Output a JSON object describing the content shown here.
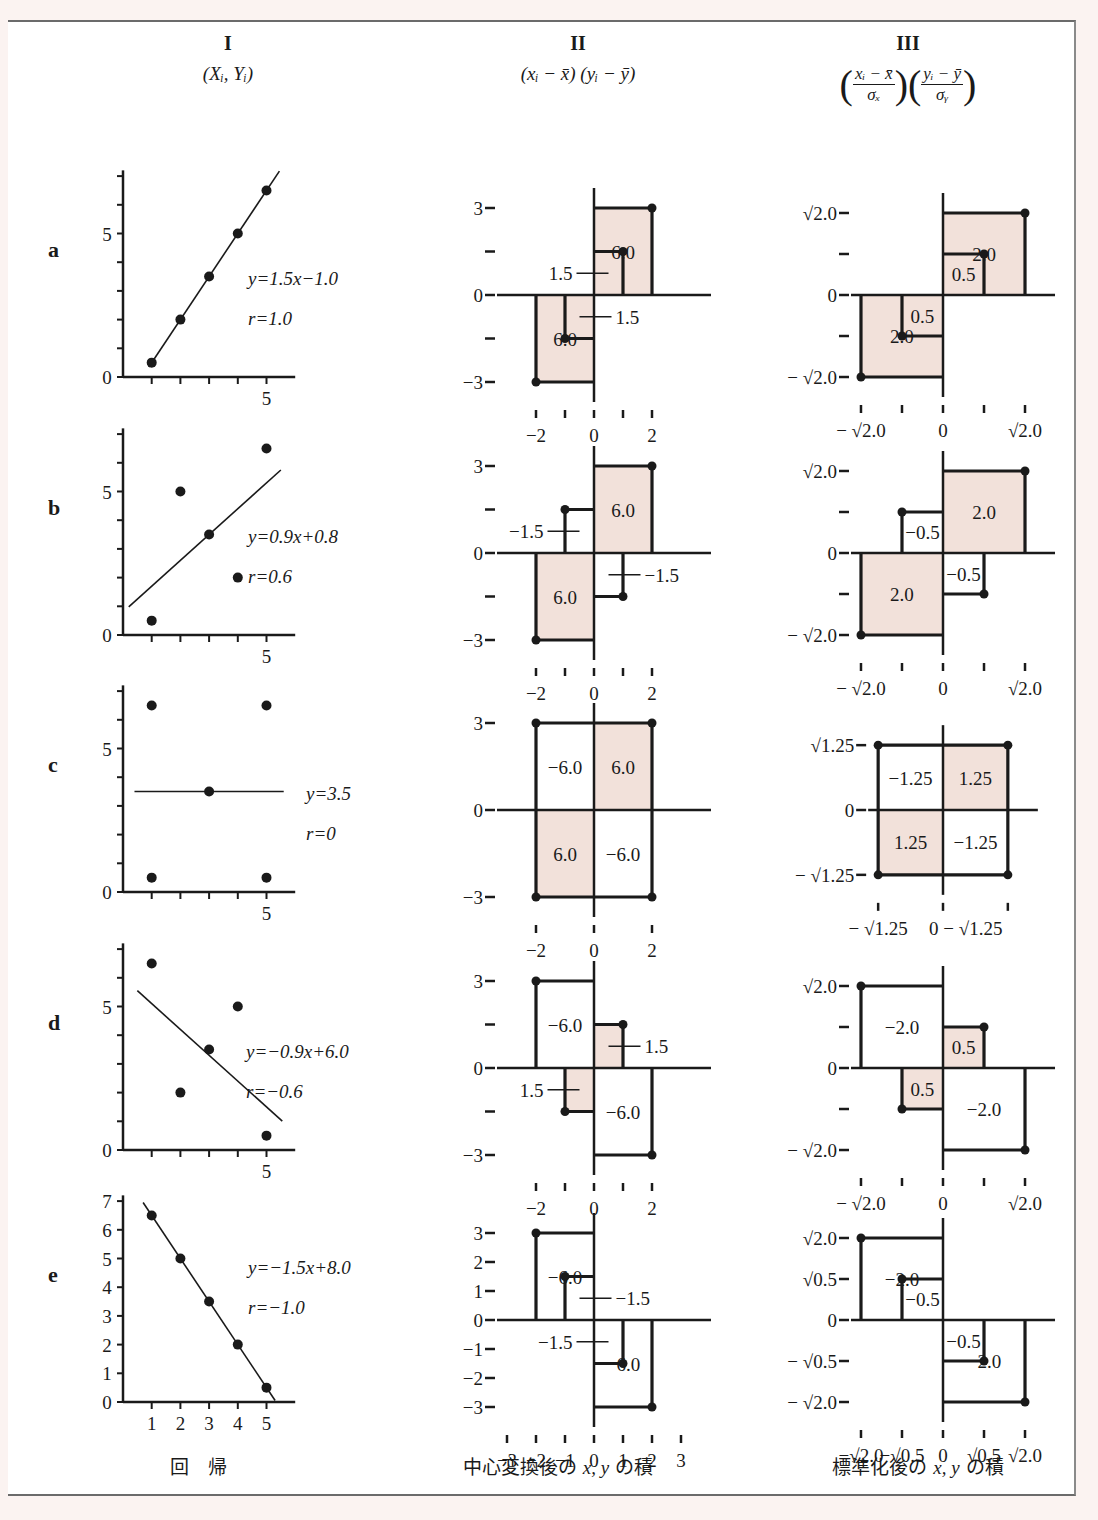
{
  "columns": [
    {
      "roman": "I",
      "formula": "(Xᵢ,  Yᵢ)"
    },
    {
      "roman": "II",
      "formula": "(xᵢ − x̄) (yᵢ − ȳ)"
    },
    {
      "roman": "III",
      "formula_num_x": "xᵢ − x̄",
      "formula_den_x": "σₓ",
      "formula_num_y": "yᵢ − ȳ",
      "formula_den_y": "σᵧ"
    }
  ],
  "footer": {
    "col1": "回　帰",
    "col2_pre": "中心変換後の ",
    "col2_vars": "x, y",
    "col2_post": " の積",
    "col3_pre": "標準化後の ",
    "col3_vars": "x, y",
    "col3_post": " の積"
  },
  "colors": {
    "shade": "#f2e1da",
    "ink": "#1a1a1a",
    "frame": "#6b6b6b"
  },
  "chart_data": [
    {
      "row": "a",
      "type": "scatter",
      "points": [
        [
          1,
          0.5
        ],
        [
          2,
          2.0
        ],
        [
          3,
          3.5
        ],
        [
          4,
          5.0
        ],
        [
          5,
          6.5
        ]
      ],
      "regression": {
        "label": "y=1.5x−1.0",
        "slope": 1.5,
        "intercept": -1.0,
        "x_from": 0.9,
        "x_to": 5.45
      },
      "r_label": "r=1.0",
      "yticks": [
        0,
        1,
        2,
        3,
        4,
        5,
        6,
        7
      ],
      "ytick_labels": {
        "0": "0",
        "5": "5"
      },
      "xticks": [
        1,
        2,
        3,
        4,
        5
      ],
      "xtick_labels": {
        "5": "5"
      },
      "xlim": [
        0,
        6
      ],
      "ylim": [
        0,
        7
      ]
    },
    {
      "row": "b",
      "type": "scatter",
      "points": [
        [
          1,
          0.5
        ],
        [
          2,
          5.0
        ],
        [
          3,
          3.5
        ],
        [
          4,
          2.0
        ],
        [
          5,
          6.5
        ]
      ],
      "regression": {
        "label": "y=0.9x+0.8",
        "slope": 0.9,
        "intercept": 0.8,
        "x_from": 0.2,
        "x_to": 5.5
      },
      "r_label": "r=0.6",
      "yticks": [
        0,
        1,
        2,
        3,
        4,
        5,
        6,
        7
      ],
      "ytick_labels": {
        "0": "0",
        "5": "5"
      },
      "xticks": [
        1,
        2,
        3,
        4,
        5
      ],
      "xtick_labels": {
        "5": "5"
      },
      "xlim": [
        0,
        6
      ],
      "ylim": [
        0,
        7
      ]
    },
    {
      "row": "c",
      "type": "scatter",
      "points": [
        [
          1,
          6.5
        ],
        [
          5,
          6.5
        ],
        [
          3,
          3.5
        ],
        [
          1,
          0.5
        ],
        [
          5,
          0.5
        ]
      ],
      "regression": {
        "label": "y=3.5",
        "slope": 0,
        "intercept": 3.5,
        "x_from": 0.4,
        "x_to": 5.6
      },
      "r_label": "r=0",
      "yticks": [
        0,
        1,
        2,
        3,
        4,
        5,
        6,
        7
      ],
      "ytick_labels": {
        "0": "0",
        "5": "5"
      },
      "xticks": [
        1,
        2,
        3,
        4,
        5
      ],
      "xtick_labels": {
        "5": "5"
      },
      "xlim": [
        0,
        6
      ],
      "ylim": [
        0,
        7
      ]
    },
    {
      "row": "d",
      "type": "scatter",
      "points": [
        [
          1,
          6.5
        ],
        [
          2,
          2.0
        ],
        [
          3,
          3.5
        ],
        [
          4,
          5.0
        ],
        [
          5,
          0.5
        ]
      ],
      "regression": {
        "label": "y=−0.9x+6.0",
        "slope": -0.9,
        "intercept": 6.0,
        "x_from": 0.5,
        "x_to": 5.55
      },
      "r_label": "r=−0.6",
      "yticks": [
        0,
        1,
        2,
        3,
        4,
        5,
        6,
        7
      ],
      "ytick_labels": {
        "0": "0",
        "5": "5"
      },
      "xticks": [
        1,
        2,
        3,
        4,
        5
      ],
      "xtick_labels": {
        "5": "5"
      },
      "xlim": [
        0,
        6
      ],
      "ylim": [
        0,
        7
      ]
    },
    {
      "row": "e",
      "type": "scatter",
      "points": [
        [
          1,
          6.5
        ],
        [
          2,
          5.0
        ],
        [
          3,
          3.5
        ],
        [
          4,
          2.0
        ],
        [
          5,
          0.5
        ]
      ],
      "regression": {
        "label": "y=−1.5x+8.0",
        "slope": -1.5,
        "intercept": 8.0,
        "x_from": 0.7,
        "x_to": 5.3
      },
      "r_label": "r=−1.0",
      "yticks": [
        0,
        1,
        2,
        3,
        4,
        5,
        6,
        7
      ],
      "ytick_labels": {
        "0": "0",
        "1": "1",
        "2": "2",
        "3": "3",
        "4": "4",
        "5": "5",
        "6": "6",
        "7": "7"
      },
      "xticks": [
        1,
        2,
        3,
        4,
        5
      ],
      "xtick_labels": {
        "1": "1",
        "2": "2",
        "3": "3",
        "4": "4",
        "5": "5"
      },
      "xlim": [
        0,
        6
      ],
      "ylim": [
        0,
        7
      ]
    }
  ],
  "centered_products": [
    {
      "row": "a",
      "range": 3,
      "ytick_vals": [
        3,
        1.5,
        0,
        -1.5,
        -3
      ],
      "ytick_labels": [
        "3",
        "",
        "0",
        "",
        "−3"
      ],
      "xtick_vals": [
        -2,
        -1,
        0,
        1,
        2
      ],
      "xtick_labels": [
        "−2",
        "",
        "0",
        "",
        "2"
      ],
      "rects": [
        {
          "x": 2,
          "y": 3,
          "value": "6.0",
          "shaded": true
        },
        {
          "x": 1,
          "y": 1.5,
          "value": "1.5",
          "shaded": true,
          "leader": "left"
        },
        {
          "x": -1,
          "y": -1.5,
          "value": "1.5",
          "shaded": true,
          "leader": "right"
        },
        {
          "x": -2,
          "y": -3,
          "value": "6.0",
          "shaded": true
        }
      ]
    },
    {
      "row": "b",
      "range": 3,
      "ytick_vals": [
        3,
        1.5,
        0,
        -1.5,
        -3
      ],
      "ytick_labels": [
        "3",
        "",
        "0",
        "",
        "−3"
      ],
      "xtick_vals": [
        -2,
        -1,
        0,
        1,
        2
      ],
      "xtick_labels": [
        "−2",
        "",
        "0",
        "",
        "2"
      ],
      "rects": [
        {
          "x": 2,
          "y": 3,
          "value": "6.0",
          "shaded": true
        },
        {
          "x": -1,
          "y": 1.5,
          "value": "−1.5",
          "shaded": false,
          "leader": "left"
        },
        {
          "x": 1,
          "y": -1.5,
          "value": "−1.5",
          "shaded": false,
          "leader": "right"
        },
        {
          "x": -2,
          "y": -3,
          "value": "6.0",
          "shaded": true
        }
      ]
    },
    {
      "row": "c",
      "range": 3,
      "ytick_vals": [
        3,
        0,
        -3
      ],
      "ytick_labels": [
        "3",
        "0",
        "−3"
      ],
      "xtick_vals": [
        -2,
        0,
        2
      ],
      "xtick_labels": [
        "−2",
        "0",
        "2"
      ],
      "rects": [
        {
          "x": 2,
          "y": 3,
          "value": "6.0",
          "shaded": true
        },
        {
          "x": -2,
          "y": 3,
          "value": "−6.0",
          "shaded": false
        },
        {
          "x": -2,
          "y": -3,
          "value": "6.0",
          "shaded": true
        },
        {
          "x": 2,
          "y": -3,
          "value": "−6.0",
          "shaded": false
        }
      ]
    },
    {
      "row": "d",
      "range": 3,
      "ytick_vals": [
        3,
        1.5,
        0,
        -1.5,
        -3
      ],
      "ytick_labels": [
        "3",
        "",
        "0",
        "",
        "−3"
      ],
      "xtick_vals": [
        -2,
        -1,
        0,
        1,
        2
      ],
      "xtick_labels": [
        "−2",
        "",
        "0",
        "",
        "2"
      ],
      "rects": [
        {
          "x": -2,
          "y": 3,
          "value": "−6.0",
          "shaded": false
        },
        {
          "x": 1,
          "y": 1.5,
          "value": "1.5",
          "shaded": true,
          "leader": "right"
        },
        {
          "x": -1,
          "y": -1.5,
          "value": "1.5",
          "shaded": true,
          "leader": "left"
        },
        {
          "x": 2,
          "y": -3,
          "value": "−6.0",
          "shaded": false
        }
      ]
    },
    {
      "row": "e",
      "range": 3,
      "ytick_vals": [
        3,
        2,
        1,
        0,
        -1,
        -2,
        -3
      ],
      "ytick_labels": [
        "3",
        "2",
        "1",
        "0",
        "−1",
        "−2",
        "−3"
      ],
      "xtick_vals": [
        -3,
        -2,
        -1,
        0,
        1,
        2,
        3
      ],
      "xtick_labels": [
        "−3",
        "−2",
        "−1",
        "0",
        "1",
        "2",
        "3"
      ],
      "rects": [
        {
          "x": -2,
          "y": 3,
          "value": "−6.0",
          "shaded": false
        },
        {
          "x": -1,
          "y": 1.5,
          "value": "−1.5",
          "shaded": false,
          "leader": "right"
        },
        {
          "x": 1,
          "y": -1.5,
          "value": "−1.5",
          "shaded": false,
          "leader": "left"
        },
        {
          "x": 2,
          "y": -3,
          "value": "−6.0",
          "shaded": false
        }
      ]
    }
  ],
  "standardized_products": [
    {
      "row": "a",
      "ytick_labels": [
        "√2.0",
        "",
        "0",
        "",
        "− √2.0"
      ],
      "xtick_labels": [
        "− √2.0",
        "",
        "0",
        "",
        "√2.0"
      ],
      "rects": [
        {
          "x": 1.414,
          "y": 1.414,
          "value": "2.0",
          "shaded": true
        },
        {
          "x": 0.707,
          "y": 0.707,
          "value": "0.5",
          "shaded": true
        },
        {
          "x": -0.707,
          "y": -0.707,
          "value": "0.5",
          "shaded": true
        },
        {
          "x": -1.414,
          "y": -1.414,
          "value": "2.0",
          "shaded": true
        }
      ]
    },
    {
      "row": "b",
      "ytick_labels": [
        "√2.0",
        "",
        "0",
        "",
        "− √2.0"
      ],
      "xtick_labels": [
        "− √2.0",
        "",
        "0",
        "",
        "√2.0"
      ],
      "rects": [
        {
          "x": 1.414,
          "y": 1.414,
          "value": "2.0",
          "shaded": true
        },
        {
          "x": -0.707,
          "y": 0.707,
          "value": "−0.5",
          "shaded": false
        },
        {
          "x": 0.707,
          "y": -0.707,
          "value": "−0.5",
          "shaded": false
        },
        {
          "x": -1.414,
          "y": -1.414,
          "value": "2.0",
          "shaded": true
        }
      ]
    },
    {
      "row": "c",
      "ytick_labels": [
        "√1.25",
        "0",
        "− √1.25"
      ],
      "xtick_labels": [
        "− √1.25",
        "0 − √1.25"
      ],
      "rects": [
        {
          "x": 1.118,
          "y": 1.118,
          "value": "1.25",
          "shaded": true
        },
        {
          "x": -1.118,
          "y": 1.118,
          "value": "−1.25",
          "shaded": false
        },
        {
          "x": -1.118,
          "y": -1.118,
          "value": "1.25",
          "shaded": true
        },
        {
          "x": 1.118,
          "y": -1.118,
          "value": "−1.25",
          "shaded": false
        }
      ]
    },
    {
      "row": "d",
      "ytick_labels": [
        "√2.0",
        "",
        "0",
        "",
        "− √2.0"
      ],
      "xtick_labels": [
        "− √2.0",
        "",
        "0",
        "",
        "√2.0"
      ],
      "rects": [
        {
          "x": -1.414,
          "y": 1.414,
          "value": "−2.0",
          "shaded": false
        },
        {
          "x": 0.707,
          "y": 0.707,
          "value": "0.5",
          "shaded": true
        },
        {
          "x": -0.707,
          "y": -0.707,
          "value": "0.5",
          "shaded": true
        },
        {
          "x": 1.414,
          "y": -1.414,
          "value": "−2.0",
          "shaded": false
        }
      ]
    },
    {
      "row": "e",
      "ytick_labels": [
        "√2.0",
        "√0.5",
        "0",
        "− √0.5",
        "− √2.0"
      ],
      "xtick_labels": [
        "−√2.0",
        "−√0.5",
        "0",
        "√0.5",
        "√2.0"
      ],
      "rects": [
        {
          "x": -1.414,
          "y": 1.414,
          "value": "−2.0",
          "shaded": false
        },
        {
          "x": -0.707,
          "y": 0.707,
          "value": "−0.5",
          "shaded": false
        },
        {
          "x": 0.707,
          "y": -0.707,
          "value": "−0.5",
          "shaded": false
        },
        {
          "x": 1.414,
          "y": -1.414,
          "value": "−2.0",
          "shaded": false
        }
      ]
    }
  ]
}
